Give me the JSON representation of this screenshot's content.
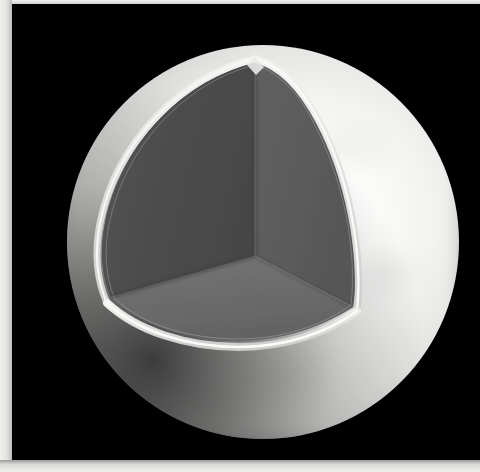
{
  "figure": {
    "kind": "cutaway-sphere-illustration",
    "background_color": "#000000",
    "paper_color": "#f2f2f0",
    "caption_text": ""
  },
  "body": {
    "name": "planetary-body",
    "center_x": 261,
    "center_y": 242,
    "radius": 197,
    "surface_color": "#e8e8e6",
    "highlight_color": "#ffffff",
    "terminator_color": "#000000"
  },
  "cutaway": {
    "label": "octant-cutaway",
    "apex_x": 250,
    "apex_y": 55,
    "center_vertex_x": 250,
    "center_vertex_y": 252,
    "crust_rim_color": "#dcdcda",
    "faces": [
      {
        "name": "left-interior-face",
        "color": "#4d4d4d"
      },
      {
        "name": "right-interior-face",
        "color": "#5e5e5e"
      },
      {
        "name": "lower-interior-face",
        "color": "#6d6d6d"
      }
    ],
    "shell_color": "#c9c9c7",
    "shell_thickness_px": 7
  },
  "colors": {
    "plate": "#000000",
    "mantle_dark": "#4d4d4d",
    "mantle_mid": "#5e5e5e",
    "mantle_light": "#6d6d6d",
    "crust": "#d8d8d6",
    "surface": "#e8e8e6"
  }
}
